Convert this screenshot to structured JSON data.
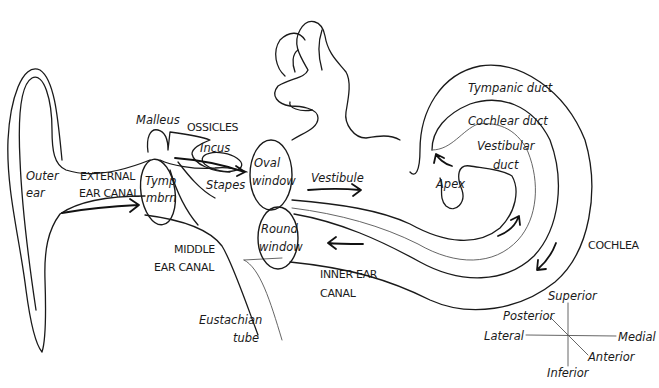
{
  "diagram": {
    "labels": {
      "outer_ear_line1": "Outer",
      "outer_ear_line2": "ear",
      "external_canal_line1": "EXTERNAL",
      "external_canal_line2": "EAR CANAL",
      "tymp_line1": "Tymp",
      "tymp_line2": "mbrn",
      "malleus": "Malleus",
      "ossicles": "OSSICLES",
      "incus": "Incus",
      "stapes": "Stapes",
      "oval_window_line1": "Oval",
      "oval_window_line2": "window",
      "round_window_line1": "Round",
      "round_window_line2": "window",
      "vestibule": "Vestibule",
      "middle_canal_line1": "MIDDLE",
      "middle_canal_line2": "EAR CANAL",
      "eustachian_line1": "Eustachian",
      "eustachian_line2": "tube",
      "inner_canal_line1": "INNER EAR",
      "inner_canal_line2": "CANAL",
      "tympanic_duct": "Tympanic duct",
      "cochlear_duct": "Cochlear duct",
      "vestibular_duct_line1": "Vestibular",
      "vestibular_duct_line2": "duct",
      "apex": "Apex",
      "cochlea": "COCHLEA"
    },
    "compass": {
      "superior": "Superior",
      "inferior": "Inferior",
      "lateral": "Lateral",
      "medial": "Medial",
      "posterior": "Posterior",
      "anterior": "Anterior"
    },
    "colors": {
      "line": "#1a1a1a",
      "background": "#ffffff"
    }
  }
}
